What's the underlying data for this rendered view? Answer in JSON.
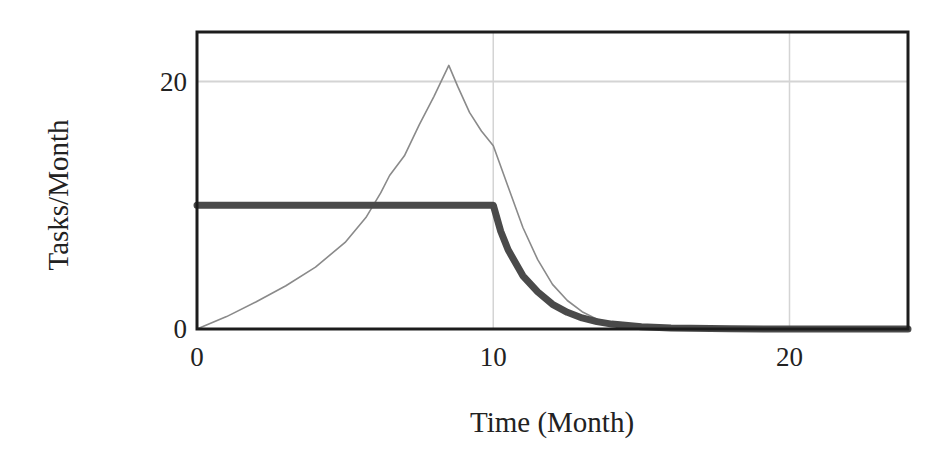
{
  "chart_data": {
    "type": "line",
    "title": "",
    "xlabel": "Time (Month)",
    "ylabel": "Tasks/Month",
    "xlim": [
      0,
      24
    ],
    "ylim": [
      0,
      24
    ],
    "x_ticks": [
      0,
      10,
      20
    ],
    "y_ticks": [
      0,
      20
    ],
    "x_tick_labels": [
      "0",
      "10",
      "20"
    ],
    "y_tick_labels": [
      "0",
      "20"
    ],
    "grid": true,
    "legend": null,
    "series": [
      {
        "name": "thin-series",
        "style": "thin",
        "color": "#8a8a8a",
        "x": [
          0,
          1,
          2,
          3,
          4,
          5,
          5.7,
          6.2,
          6.5,
          7,
          7.5,
          8,
          8.5,
          8.8,
          9.2,
          9.6,
          10,
          10.5,
          11,
          11.5,
          12,
          12.5,
          13,
          13.5,
          14,
          15,
          16,
          18,
          20,
          24
        ],
        "values": [
          0,
          1.0,
          2.2,
          3.5,
          5.0,
          7.0,
          9.0,
          11.0,
          12.4,
          14.0,
          16.5,
          18.8,
          21.3,
          19.6,
          17.5,
          16.0,
          14.8,
          11.5,
          8.2,
          5.6,
          3.6,
          2.3,
          1.4,
          0.8,
          0.45,
          0.15,
          0.05,
          0,
          0,
          0
        ]
      },
      {
        "name": "thick-series",
        "style": "thick",
        "color": "#4a4a4a",
        "x": [
          0,
          2,
          4,
          6,
          8,
          10,
          10.25,
          10.5,
          11,
          11.5,
          12,
          12.5,
          13,
          13.5,
          14,
          15,
          16,
          18,
          20,
          24
        ],
        "values": [
          10,
          10,
          10,
          10,
          10,
          10,
          7.9,
          6.4,
          4.3,
          3.0,
          2.0,
          1.35,
          0.9,
          0.6,
          0.4,
          0.18,
          0.08,
          0.02,
          0,
          0
        ]
      }
    ]
  },
  "labels": {
    "ylabel": "Tasks/Month",
    "xlabel": "Time (Month)"
  }
}
